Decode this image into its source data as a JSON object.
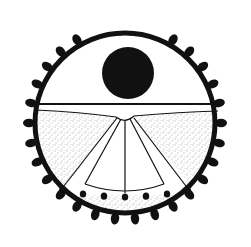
{
  "figure": {
    "colors": {
      "ink": "#111111",
      "paper": "#ffffff",
      "stipple": "#555555"
    },
    "border": {
      "cx": 125,
      "cy": 123,
      "r": 90,
      "stroke_width": 5,
      "tooth_count": 26
    },
    "sun": {
      "cx": 128,
      "cy": 73,
      "r": 26
    },
    "horizon_y": 104,
    "fan": {
      "apex_x": 125,
      "apex_y": 118,
      "bead_count": 7
    }
  }
}
